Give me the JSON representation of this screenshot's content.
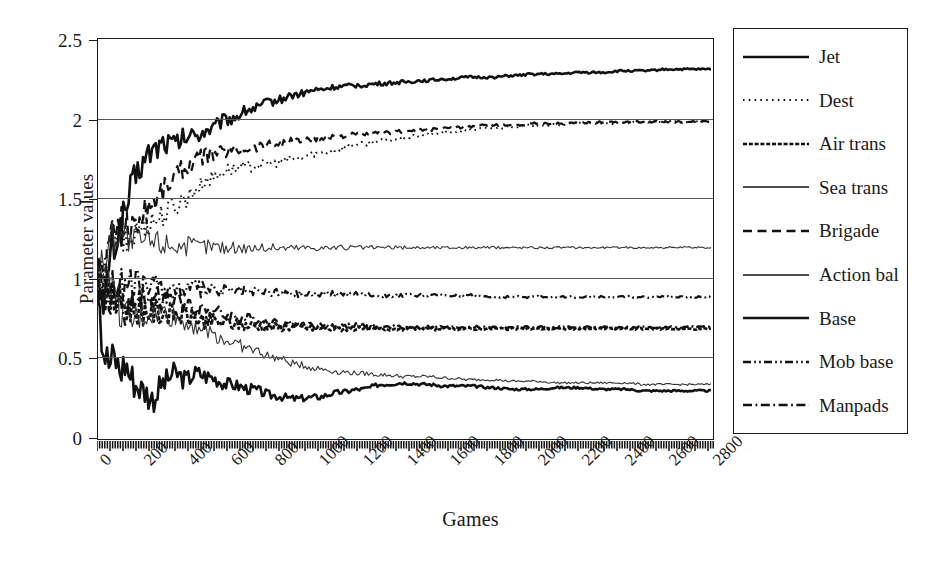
{
  "chart_data": {
    "type": "line",
    "title": "",
    "xlabel": "Games",
    "ylabel": "Parameter values",
    "xlim": [
      0,
      2800
    ],
    "ylim": [
      0,
      2.5
    ],
    "grid": "horizontal",
    "legend_position": "right-outside",
    "xticks": [
      "0",
      "200",
      "400",
      "600",
      "800",
      "1000",
      "1200",
      "1400",
      "1600",
      "1800",
      "2000",
      "2200",
      "2400",
      "2600",
      "2800"
    ],
    "yticks": [
      "0",
      "0.5",
      "1",
      "1.5",
      "2",
      "2.5"
    ],
    "x_minor_ticks": true,
    "x": [
      0,
      25,
      50,
      75,
      100,
      125,
      150,
      175,
      200,
      250,
      300,
      350,
      400,
      450,
      500,
      600,
      700,
      800,
      900,
      1000,
      1100,
      1200,
      1300,
      1400,
      1500,
      1600,
      1700,
      1800,
      1900,
      2000,
      2100,
      2200,
      2300,
      2400,
      2500,
      2600,
      2700,
      2800
    ],
    "series": [
      {
        "name": "Jet",
        "style": "solid",
        "width": 2.6,
        "color": "#111111",
        "values": [
          1.0,
          0.72,
          1.12,
          1.22,
          1.3,
          1.42,
          1.55,
          1.64,
          1.72,
          1.8,
          1.85,
          1.84,
          1.88,
          1.9,
          1.93,
          2.0,
          2.06,
          2.11,
          2.15,
          2.18,
          2.2,
          2.21,
          2.22,
          2.23,
          2.24,
          2.25,
          2.26,
          2.26,
          2.27,
          2.28,
          2.28,
          2.29,
          2.29,
          2.3,
          2.3,
          2.31,
          2.31,
          2.31
        ]
      },
      {
        "name": "Dest",
        "style": "dotted",
        "width": 1.9,
        "color": "#111111",
        "values": [
          1.0,
          0.95,
          1.2,
          1.26,
          1.28,
          1.22,
          1.25,
          1.3,
          1.33,
          1.36,
          1.4,
          1.45,
          1.5,
          1.56,
          1.62,
          1.68,
          1.7,
          1.72,
          1.75,
          1.78,
          1.81,
          1.84,
          1.86,
          1.88,
          1.9,
          1.91,
          1.93,
          1.94,
          1.95,
          1.96,
          1.96,
          1.97,
          1.97,
          1.97,
          1.98,
          1.98,
          1.98,
          1.98
        ]
      },
      {
        "name": "Air trans",
        "style": "dense-dash",
        "width": 2.6,
        "color": "#111111",
        "values": [
          1.0,
          0.95,
          0.88,
          0.85,
          0.84,
          0.83,
          0.82,
          0.8,
          0.8,
          0.79,
          0.78,
          0.77,
          0.76,
          0.74,
          0.73,
          0.71,
          0.7,
          0.69,
          0.69,
          0.68,
          0.68,
          0.68,
          0.68,
          0.68,
          0.68,
          0.68,
          0.68,
          0.68,
          0.68,
          0.68,
          0.68,
          0.68,
          0.68,
          0.68,
          0.68,
          0.68,
          0.68,
          0.68
        ]
      },
      {
        "name": "Sea trans",
        "style": "solid",
        "width": 1.1,
        "color": "#333333",
        "values": [
          1.0,
          1.02,
          0.95,
          0.88,
          0.8,
          0.74,
          0.72,
          0.74,
          0.76,
          0.78,
          0.78,
          0.75,
          0.72,
          0.7,
          0.66,
          0.6,
          0.55,
          0.5,
          0.46,
          0.43,
          0.41,
          0.4,
          0.39,
          0.38,
          0.38,
          0.37,
          0.36,
          0.36,
          0.35,
          0.35,
          0.34,
          0.34,
          0.34,
          0.34,
          0.33,
          0.33,
          0.33,
          0.33
        ]
      },
      {
        "name": "Brigade",
        "style": "dash",
        "width": 2.2,
        "color": "#111111",
        "values": [
          1.0,
          1.05,
          1.18,
          1.3,
          1.38,
          1.34,
          1.3,
          1.34,
          1.4,
          1.48,
          1.56,
          1.64,
          1.7,
          1.74,
          1.77,
          1.8,
          1.82,
          1.84,
          1.86,
          1.87,
          1.89,
          1.9,
          1.91,
          1.92,
          1.93,
          1.94,
          1.95,
          1.96,
          1.96,
          1.97,
          1.97,
          1.97,
          1.98,
          1.98,
          1.98,
          1.98,
          1.98,
          1.98
        ]
      },
      {
        "name": "Action bal",
        "style": "solid",
        "width": 1.1,
        "color": "#333333",
        "values": [
          1.0,
          1.1,
          1.22,
          1.28,
          1.3,
          1.26,
          1.22,
          1.22,
          1.23,
          1.23,
          1.22,
          1.21,
          1.2,
          1.2,
          1.2,
          1.19,
          1.19,
          1.19,
          1.19,
          1.19,
          1.19,
          1.19,
          1.19,
          1.19,
          1.19,
          1.19,
          1.19,
          1.19,
          1.19,
          1.19,
          1.19,
          1.19,
          1.19,
          1.19,
          1.19,
          1.19,
          1.19,
          1.19
        ]
      },
      {
        "name": "Base",
        "style": "solid",
        "width": 2.6,
        "color": "#111111",
        "values": [
          1.0,
          0.55,
          0.46,
          0.5,
          0.42,
          0.46,
          0.38,
          0.33,
          0.3,
          0.24,
          0.34,
          0.4,
          0.36,
          0.4,
          0.38,
          0.33,
          0.3,
          0.26,
          0.24,
          0.25,
          0.28,
          0.3,
          0.33,
          0.34,
          0.33,
          0.32,
          0.32,
          0.31,
          0.3,
          0.3,
          0.31,
          0.31,
          0.3,
          0.3,
          0.29,
          0.29,
          0.29,
          0.29
        ]
      },
      {
        "name": "Mob base",
        "style": "dash-dot-dot",
        "width": 2.2,
        "color": "#111111",
        "values": [
          1.0,
          0.98,
          0.97,
          0.96,
          0.96,
          0.95,
          0.95,
          0.95,
          0.95,
          0.94,
          0.94,
          0.93,
          0.93,
          0.93,
          0.92,
          0.92,
          0.91,
          0.91,
          0.9,
          0.9,
          0.9,
          0.9,
          0.89,
          0.89,
          0.89,
          0.89,
          0.89,
          0.88,
          0.88,
          0.88,
          0.88,
          0.88,
          0.88,
          0.88,
          0.88,
          0.88,
          0.88,
          0.88
        ]
      },
      {
        "name": "Manpads",
        "style": "dash-dot",
        "width": 2.4,
        "color": "#111111",
        "values": [
          1.0,
          0.96,
          0.9,
          0.86,
          0.83,
          0.8,
          0.82,
          0.84,
          0.86,
          0.88,
          0.88,
          0.86,
          0.84,
          0.82,
          0.8,
          0.76,
          0.74,
          0.72,
          0.71,
          0.7,
          0.7,
          0.7,
          0.69,
          0.69,
          0.69,
          0.69,
          0.69,
          0.69,
          0.69,
          0.69,
          0.69,
          0.69,
          0.69,
          0.69,
          0.69,
          0.69,
          0.69,
          0.69
        ]
      }
    ]
  },
  "legend": {
    "items": [
      {
        "label": "Jet",
        "style": "solid"
      },
      {
        "label": "Dest",
        "style": "dotted"
      },
      {
        "label": "Air trans",
        "style": "dense-dash"
      },
      {
        "label": "Sea trans",
        "style": "solid-thin"
      },
      {
        "label": "Brigade",
        "style": "dash"
      },
      {
        "label": "Action bal",
        "style": "solid-thin"
      },
      {
        "label": "Base",
        "style": "solid"
      },
      {
        "label": "Mob base",
        "style": "dash-dot-dot"
      },
      {
        "label": "Manpads",
        "style": "dash-dot"
      }
    ]
  }
}
